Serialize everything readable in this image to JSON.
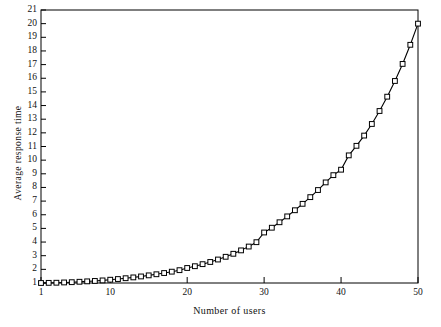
{
  "chart_data": {
    "type": "line",
    "title": "",
    "xlabel": "Number of users",
    "ylabel": "Average response time",
    "xlim": [
      1,
      50
    ],
    "ylim": [
      1,
      21
    ],
    "grid": false,
    "legend": null,
    "marker": "open-square",
    "line_color": "#000000",
    "marker_face_color": "#ffffff",
    "marker_edge_color": "#000000",
    "xticks": [
      1,
      10,
      20,
      30,
      40,
      50
    ],
    "xticklabels": [
      "1",
      "10",
      "20",
      "30",
      "40",
      "50"
    ],
    "yticks": [
      1,
      2,
      3,
      4,
      5,
      6,
      7,
      8,
      9,
      10,
      11,
      12,
      13,
      14,
      15,
      16,
      17,
      18,
      19,
      20,
      21
    ],
    "yticklabels": [
      "1",
      "2",
      "3",
      "4",
      "5",
      "6",
      "7",
      "8",
      "9",
      "10",
      "11",
      "12",
      "13",
      "14",
      "15",
      "16",
      "17",
      "18",
      "19",
      "20",
      "21"
    ],
    "series": [
      {
        "name": "Average response time",
        "x": [
          1,
          2,
          3,
          4,
          5,
          6,
          7,
          8,
          9,
          10,
          11,
          12,
          13,
          14,
          15,
          16,
          17,
          18,
          19,
          20,
          21,
          22,
          23,
          24,
          25,
          26,
          27,
          28,
          29,
          30,
          31,
          32,
          33,
          34,
          35,
          36,
          37,
          38,
          39,
          40,
          41,
          42,
          43,
          44,
          45,
          46,
          47,
          48,
          49,
          50
        ],
        "values": [
          1.0,
          1.01,
          1.02,
          1.04,
          1.06,
          1.09,
          1.12,
          1.15,
          1.19,
          1.24,
          1.29,
          1.35,
          1.41,
          1.48,
          1.56,
          1.64,
          1.73,
          1.83,
          1.94,
          2.1,
          2.23,
          2.38,
          2.54,
          2.72,
          2.92,
          3.14,
          3.39,
          3.67,
          3.99,
          4.7,
          5.05,
          5.45,
          5.88,
          6.33,
          6.8,
          7.29,
          7.81,
          8.37,
          8.9,
          9.3,
          10.35,
          11.05,
          11.8,
          12.65,
          13.6,
          14.65,
          15.8,
          17.05,
          18.45,
          20.0
        ]
      }
    ]
  },
  "axes": {
    "frame_color": "#000000"
  }
}
